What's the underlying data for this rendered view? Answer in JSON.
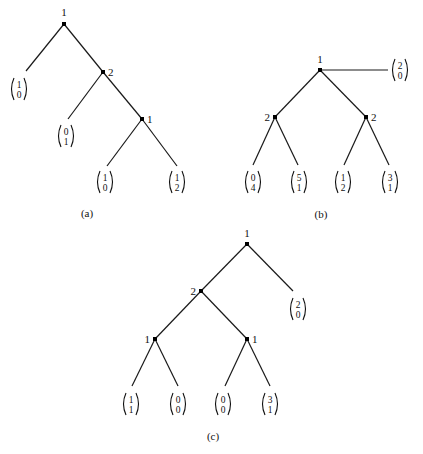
{
  "figures": [
    {
      "id": "a",
      "caption": "(a)",
      "caption_pos": [
        87,
        217
      ],
      "nodes": [
        {
          "id": "a-root",
          "x": 64,
          "y": 24,
          "label": "1",
          "lx": 64,
          "ly": 16,
          "anchor": "middle"
        },
        {
          "id": "a-n2",
          "x": 103,
          "y": 72,
          "label": "2",
          "lx": 108,
          "ly": 76,
          "anchor": "start"
        },
        {
          "id": "a-n3",
          "x": 142,
          "y": 119,
          "label": "1",
          "lx": 147,
          "ly": 123,
          "anchor": "start"
        }
      ],
      "edges": [
        [
          64,
          24,
          26,
          71
        ],
        [
          64,
          24,
          103,
          72
        ],
        [
          103,
          72,
          68,
          119
        ],
        [
          103,
          72,
          142,
          119
        ],
        [
          142,
          119,
          107,
          166
        ],
        [
          142,
          119,
          177,
          166
        ]
      ],
      "payoffs": [
        {
          "x": 19,
          "y": 89,
          "top": "1",
          "bottom": "0"
        },
        {
          "x": 66,
          "y": 136,
          "top": "0",
          "bottom": "1"
        },
        {
          "x": 105,
          "y": 182,
          "top": "1",
          "bottom": "0"
        },
        {
          "x": 177,
          "y": 182,
          "top": "1",
          "bottom": "2"
        }
      ]
    },
    {
      "id": "b",
      "caption": "(b)",
      "caption_pos": [
        321,
        218
      ],
      "nodes": [
        {
          "id": "b-root",
          "x": 320,
          "y": 70,
          "label": "1",
          "lx": 320,
          "ly": 63,
          "anchor": "middle"
        },
        {
          "id": "b-left",
          "x": 275,
          "y": 117,
          "label": "2",
          "lx": 270,
          "ly": 121,
          "anchor": "end"
        },
        {
          "id": "b-right",
          "x": 366,
          "y": 117,
          "label": "2",
          "lx": 371,
          "ly": 121,
          "anchor": "start"
        }
      ],
      "edges": [
        [
          320,
          70,
          388,
          70
        ],
        [
          320,
          70,
          275,
          117
        ],
        [
          320,
          70,
          366,
          117
        ],
        [
          275,
          117,
          253,
          165
        ],
        [
          275,
          117,
          298,
          165
        ],
        [
          366,
          117,
          344,
          165
        ],
        [
          366,
          117,
          389,
          165
        ]
      ],
      "payoffs": [
        {
          "x": 400,
          "y": 70,
          "top": "2",
          "bottom": "0"
        },
        {
          "x": 253,
          "y": 182,
          "top": "0",
          "bottom": "4"
        },
        {
          "x": 299,
          "y": 182,
          "top": "5",
          "bottom": "1"
        },
        {
          "x": 343,
          "y": 182,
          "top": "1",
          "bottom": "2"
        },
        {
          "x": 390,
          "y": 182,
          "top": "3",
          "bottom": "1"
        }
      ]
    },
    {
      "id": "c",
      "caption": "(c)",
      "caption_pos": [
        213,
        440
      ],
      "nodes": [
        {
          "id": "c-root",
          "x": 247,
          "y": 244,
          "label": "1",
          "lx": 247,
          "ly": 237,
          "anchor": "middle"
        },
        {
          "id": "c-n2",
          "x": 201,
          "y": 291,
          "label": "2",
          "lx": 196,
          "ly": 295,
          "anchor": "end"
        },
        {
          "id": "c-left",
          "x": 155,
          "y": 339,
          "label": "1",
          "lx": 150,
          "ly": 343,
          "anchor": "end"
        },
        {
          "id": "c-right",
          "x": 247,
          "y": 339,
          "label": "1",
          "lx": 252,
          "ly": 343,
          "anchor": "start"
        }
      ],
      "edges": [
        [
          247,
          244,
          293,
          291
        ],
        [
          247,
          244,
          201,
          291
        ],
        [
          201,
          291,
          155,
          339
        ],
        [
          201,
          291,
          247,
          339
        ],
        [
          155,
          339,
          132,
          386
        ],
        [
          155,
          339,
          178,
          386
        ],
        [
          247,
          339,
          225,
          386
        ],
        [
          247,
          339,
          270,
          386
        ]
      ],
      "payoffs": [
        {
          "x": 298,
          "y": 309,
          "top": "2",
          "bottom": "0"
        },
        {
          "x": 131,
          "y": 404,
          "top": "1",
          "bottom": "1"
        },
        {
          "x": 178,
          "y": 404,
          "top": "0",
          "bottom": "0"
        },
        {
          "x": 223,
          "y": 404,
          "top": "0",
          "bottom": "0"
        },
        {
          "x": 270,
          "y": 404,
          "top": "3",
          "bottom": "1"
        }
      ]
    }
  ]
}
